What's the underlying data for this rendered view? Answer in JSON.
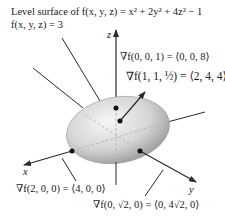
{
  "title": {
    "line1": "Level surface of f(x, y, z) = x² + 2y² + 4z² − 1",
    "line2": "f(x, y, z) = 3"
  },
  "axes": {
    "x_label": "x",
    "y_label": "y",
    "z_label": "z"
  },
  "gradients": [
    {
      "point": "(0, 0, 1)",
      "label": "∇f(0, 0, 1) = ⟨0, 0, 8⟩"
    },
    {
      "point": "(1, 1, 1/2)",
      "label": "∇f(1, 1, ½) = ⟨2, 4, 4⟩"
    },
    {
      "point": "(2, 0, 0)",
      "label": "∇f(2, 0, 0) = ⟨4, 0, 0⟩"
    },
    {
      "point": "(0, √2, 0)",
      "label": "∇f(0, √2, 0) = ⟨0, 4√2, 0⟩"
    }
  ],
  "colors": {
    "surface_light": "#f4f4f4",
    "surface_dark": "#8a8a8a",
    "line": "#2a2a2a"
  }
}
